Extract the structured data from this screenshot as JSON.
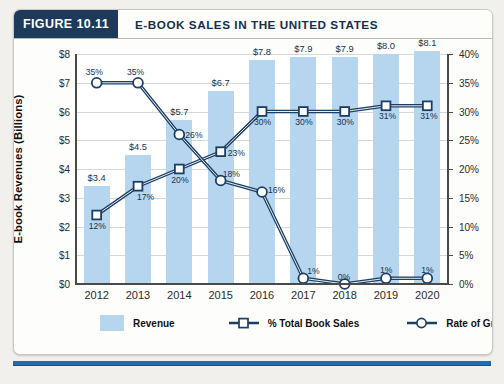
{
  "figure": {
    "tag": "FIGURE 10.11",
    "title": "E-BOOK SALES IN THE UNITED STATES"
  },
  "legend": {
    "revenue": "Revenue",
    "pct_total_book_sales": "% Total Book Sales",
    "rate_of_growth": "Rate of Growth"
  },
  "colors": {
    "bar": "#b6d6f0",
    "line": "#1c3f66",
    "header_tag_bg": "#1d3a5c",
    "footer_rule": "#1f6cb0",
    "grid": "#d7d7d7"
  },
  "chart_data": {
    "type": "bar",
    "title": "E-BOOK SALES IN THE UNITED STATES",
    "xlabel": "",
    "ylabel": "E-book Revenues (Billions)",
    "y2label": "",
    "categories": [
      "2012",
      "2013",
      "2014",
      "2015",
      "2016",
      "2017",
      "2018",
      "2019",
      "2020"
    ],
    "ylim": [
      0,
      8
    ],
    "y2lim": [
      0,
      40
    ],
    "yticks": [
      "$0",
      "$1",
      "$2",
      "$3",
      "$4",
      "$5",
      "$6",
      "$7",
      "$8"
    ],
    "y2ticks": [
      "0%",
      "5%",
      "10%",
      "15%",
      "20%",
      "25%",
      "30%",
      "35%",
      "40%"
    ],
    "grid": true,
    "legend_position": "bottom",
    "series": [
      {
        "name": "Revenue",
        "type": "bar",
        "axis": "left",
        "unit": "billions USD",
        "values": [
          3.4,
          4.5,
          5.7,
          6.7,
          7.8,
          7.9,
          7.9,
          8.0,
          8.1
        ],
        "labels": [
          "$3.4",
          "$4.5",
          "$5.7",
          "$6.7",
          "$7.8",
          "$7.9",
          "$7.9",
          "$8.0",
          "$8.1"
        ]
      },
      {
        "name": "% Total Book Sales",
        "type": "line",
        "marker": "square",
        "axis": "right",
        "unit": "percent",
        "values": [
          12,
          17,
          20,
          23,
          30,
          30,
          30,
          31,
          31
        ],
        "labels": [
          "12%",
          "17%",
          "20%",
          "23%",
          "30%",
          "30%",
          "30%",
          "31%",
          "31%"
        ]
      },
      {
        "name": "Rate of Growth",
        "type": "line",
        "marker": "circle",
        "axis": "right",
        "unit": "percent",
        "values": [
          35,
          35,
          26,
          18,
          16,
          1,
          0,
          1,
          1
        ],
        "labels": [
          "35%",
          "35%",
          "26%",
          "18%",
          "16%",
          "1%",
          "0%",
          "1%",
          "1%"
        ]
      }
    ]
  }
}
